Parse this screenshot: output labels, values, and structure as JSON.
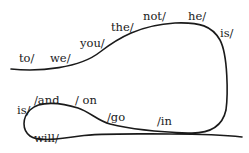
{
  "diagram": {
    "type": "word-chain path",
    "curve_color": "#1a1a1a",
    "words": [
      {
        "id": "to",
        "text": "to/",
        "x": 19,
        "y": 53
      },
      {
        "id": "we",
        "text": "we/",
        "x": 50,
        "y": 53
      },
      {
        "id": "you",
        "text": "you/",
        "x": 80,
        "y": 38
      },
      {
        "id": "the",
        "text": "the/",
        "x": 111,
        "y": 22
      },
      {
        "id": "not",
        "text": "not/",
        "x": 143,
        "y": 12
      },
      {
        "id": "he",
        "text": "he/",
        "x": 188,
        "y": 12
      },
      {
        "id": "is_top",
        "text": "is/",
        "x": 220,
        "y": 30
      },
      {
        "id": "is_bottom",
        "text": "is/",
        "x": 17,
        "y": 107
      },
      {
        "id": "and",
        "text": "/and",
        "x": 34,
        "y": 96
      },
      {
        "id": "on",
        "text": "/ on",
        "x": 75,
        "y": 96
      },
      {
        "id": "go",
        "text": "/go",
        "x": 108,
        "y": 113
      },
      {
        "id": "in",
        "text": "/in",
        "x": 157,
        "y": 118
      },
      {
        "id": "will",
        "text": "will/",
        "x": 34,
        "y": 135
      }
    ]
  }
}
